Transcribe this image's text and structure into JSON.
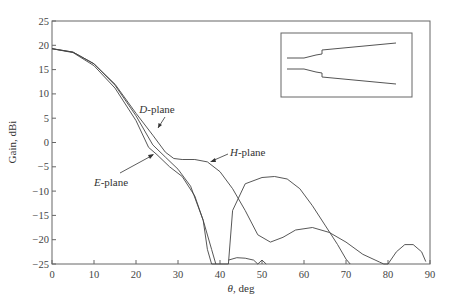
{
  "chart_data": {
    "type": "line",
    "title": "",
    "xlabel": "θ, deg",
    "ylabel": "Gain, dBi",
    "xlim": [
      0,
      90
    ],
    "ylim": [
      -25,
      25
    ],
    "xticks": [
      0,
      10,
      20,
      30,
      40,
      50,
      60,
      70,
      80,
      90
    ],
    "yticks": [
      25,
      20,
      15,
      10,
      5,
      0,
      -5,
      -10,
      -15,
      -20,
      -25
    ],
    "grid": false,
    "legend": "inline annotations with arrows",
    "annotations": [
      {
        "text": "D-plane",
        "italic_prefix": "D",
        "x": 30,
        "y": 0
      },
      {
        "text": "E-plane",
        "italic_prefix": "E",
        "x": 20,
        "y": -6
      },
      {
        "text": "H-plane",
        "italic_prefix": "H",
        "x": 43,
        "y": -3.5
      }
    ],
    "inset": "horn antenna profile outline",
    "series": [
      {
        "name": "D-plane",
        "x": [
          0,
          5,
          10,
          15,
          20,
          24,
          27,
          30,
          33,
          36,
          38,
          39
        ],
        "y": [
          19.3,
          18.6,
          16.2,
          11.8,
          5.5,
          -0.5,
          -3,
          -5.5,
          -9,
          -16,
          -22,
          -25
        ]
      },
      {
        "name": "E-plane",
        "x": [
          0,
          5,
          10,
          15,
          20,
          23,
          25,
          28,
          31,
          34,
          36,
          37,
          38,
          42,
          43,
          46,
          50,
          53,
          56,
          59,
          62,
          65,
          68,
          70,
          71
        ],
        "y": [
          19.3,
          18.5,
          15.8,
          11.2,
          4.5,
          -1,
          -2.5,
          -5,
          -7,
          -11,
          -16,
          -22,
          -25,
          -25,
          -14,
          -8.5,
          -7.2,
          -7,
          -7.5,
          -9.5,
          -13,
          -17,
          -21,
          -24,
          -25
        ]
      },
      {
        "name": "H-plane",
        "x": [
          0,
          5,
          10,
          15,
          20,
          24,
          27,
          29,
          31,
          34,
          37,
          40,
          43,
          46,
          49,
          52,
          55,
          58,
          62,
          66,
          70,
          74,
          78,
          79,
          80,
          82,
          84,
          86,
          88,
          89
        ],
        "y": [
          19.3,
          18.6,
          16.2,
          12,
          6,
          1.5,
          -2,
          -3.3,
          -3.5,
          -3.5,
          -4,
          -6,
          -9.5,
          -14,
          -19,
          -20.5,
          -19.5,
          -18,
          -17.5,
          -18.5,
          -20.5,
          -23,
          -24.6,
          -25,
          -25,
          -22.5,
          -21,
          -21,
          -22.5,
          -24.5
        ]
      },
      {
        "name": "E-plane minor lobes",
        "x": [
          42,
          44,
          46,
          48,
          49,
          50,
          51
        ],
        "y": [
          -24.2,
          -23.7,
          -23.8,
          -24.2,
          -25,
          -24.2,
          -25
        ]
      }
    ]
  }
}
